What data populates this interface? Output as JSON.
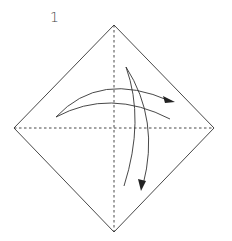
{
  "diagram": {
    "type": "origami-fold-step",
    "step_number": "1",
    "shape": "square-rotated-diamond",
    "vertices": {
      "top": [
        114,
        25
      ],
      "left": [
        14,
        128
      ],
      "right": [
        214,
        128
      ],
      "bottom": [
        114,
        232
      ]
    },
    "crease_lines": [
      {
        "name": "vertical-diagonal",
        "style": "dashed",
        "from": "top",
        "to": "bottom"
      },
      {
        "name": "horizontal-diagonal",
        "style": "dashed",
        "from": "left",
        "to": "right"
      }
    ],
    "arrows": [
      {
        "name": "fold-arrow-horizontal",
        "direction": "left-to-right",
        "description": "valley fold and unfold across vertical diagonal"
      },
      {
        "name": "fold-arrow-vertical",
        "direction": "top-to-bottom",
        "description": "valley fold and unfold across horizontal diagonal"
      }
    ],
    "colors": {
      "line": "#333333",
      "background": "#ffffff"
    }
  }
}
